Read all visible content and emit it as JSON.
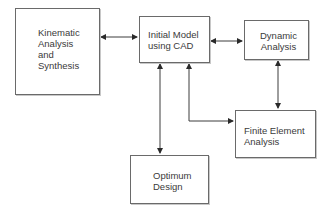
{
  "diagram": {
    "type": "flowchart",
    "nodes": [
      {
        "id": "kinematic",
        "label": "Kinematic\nAnalysis\nand\nSynthesis"
      },
      {
        "id": "initial",
        "label": "Initial Model\nusing CAD"
      },
      {
        "id": "dynamic",
        "label": "Dynamic\nAnalysis"
      },
      {
        "id": "fea",
        "label": "Finite Element\nAnalysis"
      },
      {
        "id": "optimum",
        "label": "Optimum\nDesign"
      }
    ],
    "edges": [
      {
        "from": "kinematic",
        "to": "initial",
        "direction": "both"
      },
      {
        "from": "initial",
        "to": "dynamic",
        "direction": "both"
      },
      {
        "from": "initial",
        "to": "optimum",
        "direction": "both"
      },
      {
        "from": "initial",
        "to": "fea",
        "direction": "both"
      },
      {
        "from": "dynamic",
        "to": "fea",
        "direction": "both"
      }
    ]
  },
  "colors": {
    "line": "#3c3c3c",
    "border": "#6a6a6a",
    "text": "#3a3a3a"
  }
}
